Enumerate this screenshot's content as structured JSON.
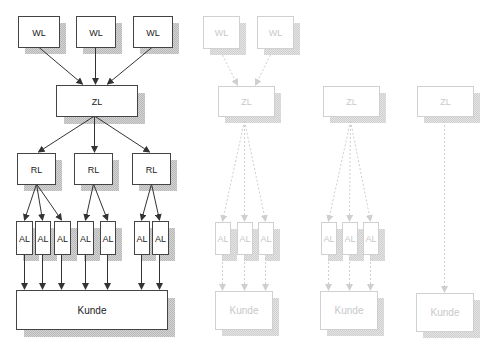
{
  "colors": {
    "box_stroke": "#444444",
    "box_fill": "#ffffff",
    "shadow": "#c4c4c4",
    "arrow": "#333333",
    "faded_stroke": "#d0d0d0",
    "faded_text": "#c8c8c8",
    "faded_shadow": "#d9d9d9",
    "faded_arrow": "#cfcfcf"
  },
  "diagrams": [
    {
      "id": "full-network",
      "faded": false,
      "boxes": [
        {
          "id": "wl1",
          "label": "WL",
          "x": 18,
          "y": 16,
          "w": 41,
          "h": 31
        },
        {
          "id": "wl2",
          "label": "WL",
          "x": 76,
          "y": 16,
          "w": 39,
          "h": 31
        },
        {
          "id": "wl3",
          "label": "WL",
          "x": 133,
          "y": 16,
          "w": 39,
          "h": 31
        },
        {
          "id": "zl",
          "label": "ZL",
          "x": 56,
          "y": 85,
          "w": 81,
          "h": 31
        },
        {
          "id": "rl1",
          "label": "RL",
          "x": 17,
          "y": 153,
          "w": 38,
          "h": 31
        },
        {
          "id": "rl2",
          "label": "RL",
          "x": 74,
          "y": 153,
          "w": 38,
          "h": 31
        },
        {
          "id": "rl3",
          "label": "RL",
          "x": 132,
          "y": 153,
          "w": 38,
          "h": 31
        },
        {
          "id": "al1",
          "label": "AL",
          "x": 16,
          "y": 221,
          "w": 16,
          "h": 33
        },
        {
          "id": "al2",
          "label": "AL",
          "x": 35,
          "y": 221,
          "w": 15,
          "h": 33
        },
        {
          "id": "al3",
          "label": "AL",
          "x": 54,
          "y": 221,
          "w": 16,
          "h": 33
        },
        {
          "id": "al4",
          "label": "AL",
          "x": 77,
          "y": 221,
          "w": 16,
          "h": 33
        },
        {
          "id": "al5",
          "label": "AL",
          "x": 100,
          "y": 221,
          "w": 15,
          "h": 33
        },
        {
          "id": "al6",
          "label": "AL",
          "x": 134,
          "y": 221,
          "w": 15,
          "h": 33
        },
        {
          "id": "al7",
          "label": "AL",
          "x": 152,
          "y": 221,
          "w": 16,
          "h": 33
        },
        {
          "id": "kunde",
          "label": "Kunde",
          "x": 16,
          "y": 290,
          "w": 151,
          "h": 39
        }
      ],
      "arrows": [
        {
          "from": [
            38,
            47
          ],
          "to": [
            82,
            85
          ]
        },
        {
          "from": [
            95,
            47
          ],
          "to": [
            95,
            85
          ]
        },
        {
          "from": [
            152,
            47
          ],
          "to": [
            107,
            85
          ]
        },
        {
          "from": [
            94,
            116
          ],
          "to": [
            38,
            153
          ]
        },
        {
          "from": [
            94,
            116
          ],
          "to": [
            94,
            153
          ]
        },
        {
          "from": [
            94,
            116
          ],
          "to": [
            149,
            153
          ]
        },
        {
          "from": [
            36,
            184
          ],
          "to": [
            24,
            221
          ]
        },
        {
          "from": [
            36,
            184
          ],
          "to": [
            42,
            221
          ]
        },
        {
          "from": [
            36,
            184
          ],
          "to": [
            61,
            221
          ]
        },
        {
          "from": [
            93,
            184
          ],
          "to": [
            85,
            221
          ]
        },
        {
          "from": [
            93,
            184
          ],
          "to": [
            107,
            221
          ]
        },
        {
          "from": [
            151,
            184
          ],
          "to": [
            141,
            221
          ]
        },
        {
          "from": [
            151,
            184
          ],
          "to": [
            159,
            221
          ]
        },
        {
          "from": [
            24,
            254
          ],
          "to": [
            24,
            290
          ]
        },
        {
          "from": [
            42,
            254
          ],
          "to": [
            42,
            290
          ]
        },
        {
          "from": [
            61,
            254
          ],
          "to": [
            61,
            290
          ]
        },
        {
          "from": [
            85,
            254
          ],
          "to": [
            85,
            290
          ]
        },
        {
          "from": [
            107,
            254
          ],
          "to": [
            107,
            290
          ]
        },
        {
          "from": [
            141,
            254
          ],
          "to": [
            141,
            290
          ]
        },
        {
          "from": [
            159,
            254
          ],
          "to": [
            159,
            290
          ]
        }
      ]
    },
    {
      "id": "two-warehouse-path",
      "faded": true,
      "boxes": [
        {
          "id": "wl1",
          "label": "WL",
          "x": 203,
          "y": 16,
          "w": 36,
          "h": 32
        },
        {
          "id": "wl2",
          "label": "WL",
          "x": 257,
          "y": 16,
          "w": 36,
          "h": 32
        },
        {
          "id": "zl",
          "label": "ZL",
          "x": 218,
          "y": 86,
          "w": 56,
          "h": 30
        },
        {
          "id": "al1",
          "label": "AL",
          "x": 215,
          "y": 222,
          "w": 15,
          "h": 32
        },
        {
          "id": "al2",
          "label": "AL",
          "x": 237,
          "y": 222,
          "w": 15,
          "h": 32
        },
        {
          "id": "al3",
          "label": "AL",
          "x": 258,
          "y": 222,
          "w": 15,
          "h": 32
        },
        {
          "id": "kunde",
          "label": "Kunde",
          "x": 215,
          "y": 291,
          "w": 57,
          "h": 38
        }
      ],
      "arrows": [
        {
          "from": [
            222,
            55
          ],
          "to": [
            237,
            86
          ]
        },
        {
          "from": [
            270,
            55
          ],
          "to": [
            255,
            86
          ]
        },
        {
          "from": [
            244,
            121
          ],
          "to": [
            222,
            222
          ]
        },
        {
          "from": [
            244,
            121
          ],
          "to": [
            244,
            222
          ]
        },
        {
          "from": [
            244,
            121
          ],
          "to": [
            265,
            222
          ]
        },
        {
          "from": [
            222,
            254
          ],
          "to": [
            222,
            291
          ]
        },
        {
          "from": [
            244,
            254
          ],
          "to": [
            244,
            291
          ]
        },
        {
          "from": [
            265,
            254
          ],
          "to": [
            265,
            291
          ]
        }
      ]
    },
    {
      "id": "central-warehouse-path",
      "faded": true,
      "boxes": [
        {
          "id": "zl",
          "label": "ZL",
          "x": 323,
          "y": 86,
          "w": 56,
          "h": 30
        },
        {
          "id": "al1",
          "label": "AL",
          "x": 321,
          "y": 222,
          "w": 15,
          "h": 32
        },
        {
          "id": "al2",
          "label": "AL",
          "x": 342,
          "y": 222,
          "w": 15,
          "h": 32
        },
        {
          "id": "al3",
          "label": "AL",
          "x": 363,
          "y": 222,
          "w": 15,
          "h": 32
        },
        {
          "id": "kunde",
          "label": "Kunde",
          "x": 320,
          "y": 291,
          "w": 57,
          "h": 38
        }
      ],
      "arrows": [
        {
          "from": [
            350,
            121
          ],
          "to": [
            328,
            222
          ]
        },
        {
          "from": [
            350,
            121
          ],
          "to": [
            349,
            222
          ]
        },
        {
          "from": [
            350,
            121
          ],
          "to": [
            370,
            222
          ]
        },
        {
          "from": [
            328,
            254
          ],
          "to": [
            328,
            291
          ]
        },
        {
          "from": [
            349,
            254
          ],
          "to": [
            349,
            291
          ]
        },
        {
          "from": [
            370,
            254
          ],
          "to": [
            370,
            291
          ]
        }
      ]
    },
    {
      "id": "direct-path",
      "faded": true,
      "boxes": [
        {
          "id": "zl",
          "label": "ZL",
          "x": 417,
          "y": 86,
          "w": 56,
          "h": 30
        },
        {
          "id": "kunde",
          "label": "Kunde",
          "x": 416,
          "y": 293,
          "w": 57,
          "h": 38
        }
      ],
      "arrows": [
        {
          "from": [
            444,
            121
          ],
          "to": [
            444,
            293
          ]
        }
      ]
    }
  ]
}
